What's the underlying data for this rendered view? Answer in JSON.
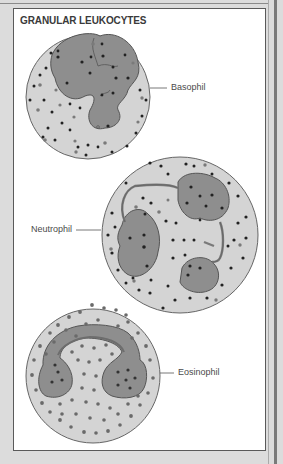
{
  "figure": {
    "title": "GRANULAR LEUKOCYTES",
    "cells": [
      {
        "name": "Basophil",
        "label": "Basophil"
      },
      {
        "name": "Neutrophil",
        "label": "Neutrophil"
      },
      {
        "name": "Eosinophil",
        "label": "Eosinophil"
      }
    ]
  },
  "colors": {
    "background": "#dcdcdc",
    "panel": "#ffffff",
    "cytoplasm": "#d2d2d2",
    "nucleus": "#8c8c8c",
    "granule_dark": "#222222",
    "granule_gray": "#777777",
    "outline": "#555555"
  }
}
